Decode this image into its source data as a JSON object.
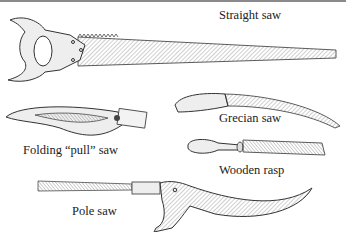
{
  "figure": {
    "labels": {
      "straight_saw": "Straight saw",
      "folding_pull_saw": "Folding “pull” saw",
      "grecian_saw": "Grecian saw",
      "wooden_rasp": "Wooden rasp",
      "pole_saw": "Pole saw"
    }
  }
}
